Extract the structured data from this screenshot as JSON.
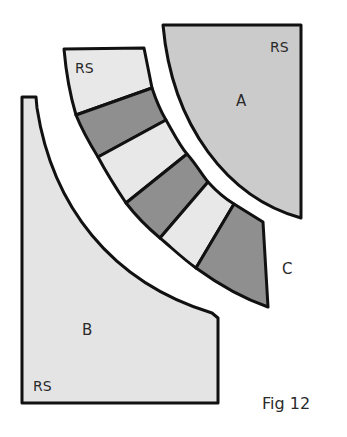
{
  "figure": {
    "caption": "Fig 12",
    "colors": {
      "light_fill": "#e4e4e4",
      "mid_fill": "#cbcbcb",
      "dark_fill": "#8f8f8f",
      "outline": "#111111",
      "background": "#ffffff"
    },
    "pieces": {
      "A": {
        "label": "A",
        "side_label": "RS"
      },
      "B": {
        "label": "B",
        "side_label": "RS"
      },
      "C": {
        "label": "C",
        "side_label": "RS",
        "segments": 7
      }
    }
  }
}
